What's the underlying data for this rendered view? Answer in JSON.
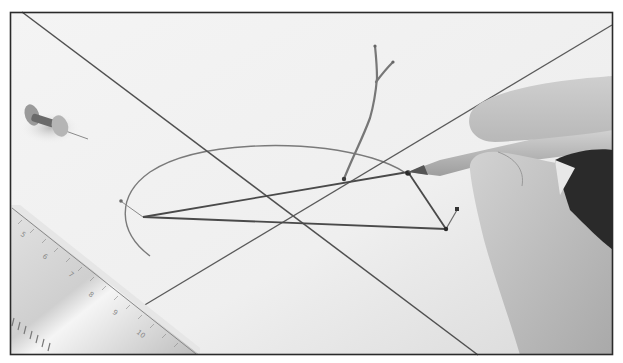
{
  "figure": {
    "frame": {
      "x": 10,
      "y": 12,
      "width": 603,
      "height": 343,
      "border_color": "#2a2a2a"
    },
    "paper_color": "#f2f2f2",
    "line_color": "#4a4a4a",
    "ruler": {
      "tick_labels": [
        "5",
        "6",
        "7",
        "8",
        "9",
        "10"
      ]
    },
    "objects": [
      {
        "name": "pushpin"
      },
      {
        "name": "ruler"
      },
      {
        "name": "pencil"
      },
      {
        "name": "hand"
      },
      {
        "name": "wire-twig"
      },
      {
        "name": "triangle"
      },
      {
        "name": "elliptical-arc"
      },
      {
        "name": "crossing-lines"
      }
    ]
  }
}
